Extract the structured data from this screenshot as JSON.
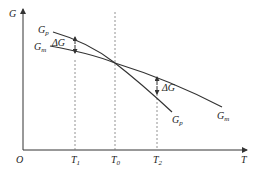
{
  "diagram": {
    "title": "",
    "axes": {
      "y_label": "G",
      "x_label": "T",
      "origin_label": "O"
    },
    "x_ticks": [
      {
        "label_main": "T",
        "label_sub": "1"
      },
      {
        "label_main": "T",
        "label_sub": "0"
      },
      {
        "label_main": "T",
        "label_sub": "2"
      }
    ],
    "curves": [
      {
        "name": "Gp",
        "label_main": "G",
        "label_sub": "p"
      },
      {
        "name": "Gm",
        "label_main": "G",
        "label_sub": "m"
      }
    ],
    "annotations": [
      {
        "label": "ΔG",
        "position": "at T1"
      },
      {
        "label": "ΔG",
        "position": "at T2"
      }
    ],
    "colors": {
      "line": "#333333",
      "dashed": "#777777",
      "background": "#ffffff"
    }
  }
}
